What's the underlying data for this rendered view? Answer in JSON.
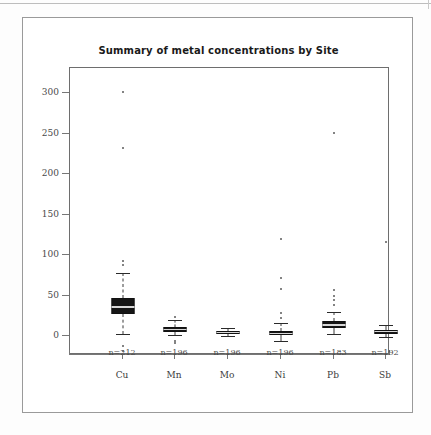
{
  "figure": {
    "title": "Summary of metal concentrations by Site"
  },
  "axes": {
    "y_ticks": [
      "300",
      "250",
      "200",
      "150",
      "100",
      "50",
      "0"
    ],
    "y_tick_values": [
      300,
      250,
      200,
      150,
      100,
      50,
      0
    ],
    "x_labels": [
      "Cu",
      "Mn",
      "Mo",
      "Ni",
      "Pb",
      "Sb"
    ],
    "n_labels": [
      "n=212",
      "n=196",
      "n=196",
      "n=196",
      "n=183",
      "n=192"
    ]
  },
  "chart_data": {
    "type": "box",
    "title": "Summary of metal concentrations by Site",
    "subtitle": "",
    "xlabel": "",
    "ylabel": "",
    "ylim": [
      -20,
      310
    ],
    "grid": false,
    "legend": "none",
    "categories": [
      "Cu",
      "Mn",
      "Mo",
      "Ni",
      "Pb",
      "Sb"
    ],
    "counts": [
      212,
      196,
      196,
      196,
      183,
      192
    ],
    "count_labels": [
      "n=212",
      "n=196",
      "n=196",
      "n=196",
      "n=183",
      "n=192"
    ],
    "boxes": [
      {
        "name": "Cu",
        "n": 212,
        "whisker_low": 3,
        "q1": 27,
        "median": 37,
        "q3": 47,
        "whisker_high": 78,
        "outliers": [
          301,
          232,
          93,
          88,
          -12,
          -18
        ]
      },
      {
        "name": "Mn",
        "n": 196,
        "whisker_low": 1,
        "q1": 5,
        "median": 8,
        "q3": 11,
        "whisker_high": 20,
        "outliers": [
          24,
          -6,
          -9
        ]
      },
      {
        "name": "Mo",
        "n": 196,
        "whisker_low": 0,
        "q1": 3,
        "median": 4,
        "q3": 6,
        "whisker_high": 10,
        "outliers": []
      },
      {
        "name": "Ni",
        "n": 196,
        "whisker_low": -6,
        "q1": 1,
        "median": 3,
        "q3": 6,
        "whisker_high": 16,
        "outliers": [
          120,
          72,
          58,
          28,
          22
        ]
      },
      {
        "name": "Pb",
        "n": 183,
        "whisker_low": 2,
        "q1": 10,
        "median": 14,
        "q3": 18,
        "whisker_high": 30,
        "outliers": [
          251,
          57,
          50,
          44,
          38
        ]
      },
      {
        "name": "Sb",
        "n": 192,
        "whisker_low": -1,
        "q1": 3,
        "median": 5,
        "q3": 7,
        "whisker_high": 13,
        "outliers": [
          116
        ]
      }
    ]
  },
  "layout": {
    "panel_left": 46,
    "panel_top": 49,
    "panel_width": 320,
    "panel_height": 287,
    "y_zero_px": 268,
    "px_per_unit": 0.81,
    "group_centers_px": [
      53,
      105,
      158,
      211,
      264,
      316
    ],
    "box_width_px": 23
  },
  "colors": {
    "box_fill": "#161616",
    "median": "#d8d8d8",
    "whisker": "#3a3a3a",
    "outlier": "#5a5a5a",
    "panel_border": "#6e6e6e",
    "frame": "#9a9a9a",
    "text": "#3b3b3b",
    "background": "#ffffff"
  }
}
